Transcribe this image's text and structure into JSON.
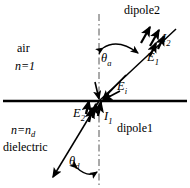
{
  "figure": {
    "width": 190,
    "height": 188,
    "background": "#ffffff",
    "ink": "#000000"
  },
  "regions": {
    "upper": {
      "medium_label": "air",
      "index_label": "n=1",
      "index_symbol": "n",
      "index_value": "1"
    },
    "lower": {
      "medium_label": "dielectric",
      "index_label": "n=n",
      "index_symbol": "n",
      "index_value": "n",
      "index_subscript": "d"
    }
  },
  "dipoles": {
    "upper": {
      "label": "dipole2",
      "angle_label": "θ",
      "angle_subscript": "a",
      "field_label": "E",
      "field_subscript": "1",
      "current_label": "I",
      "current_subscript": "2"
    },
    "lower": {
      "label": "dipole1",
      "angle_label": "θ",
      "angle_subscript": "d",
      "field_label": "E",
      "field_subscript": "2",
      "current_label": "I",
      "current_subscript": "1"
    }
  },
  "interface_field": {
    "label": "E",
    "subscript": "i"
  },
  "lines": {
    "interface_label": "interface-line",
    "normal_label": "normal-dash-dot-line",
    "dipole2_label": "dipole2-axis",
    "dipole1_label": "dipole1-axis"
  },
  "geometry": {
    "origin_x": 99,
    "origin_y": 101,
    "interface_y": 101,
    "normal_x": 99,
    "dipole2_end_x": 176,
    "dipole2_end_y": 29,
    "dipole1_end_x": 49,
    "dipole1_end_y": 181
  }
}
